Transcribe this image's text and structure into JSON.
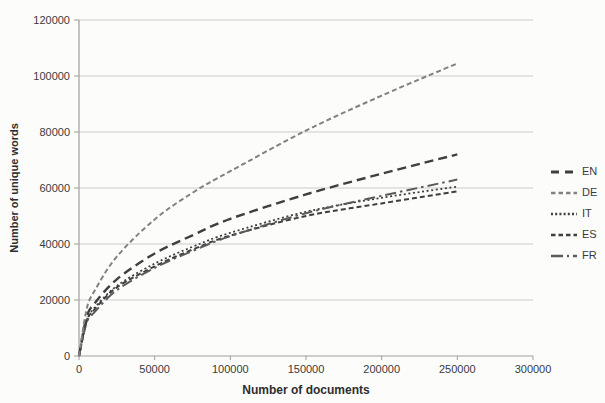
{
  "chart_data": {
    "type": "line",
    "title": "",
    "xlabel": "Number of documents",
    "ylabel": "Number of unique words",
    "xlim": [
      0,
      300000
    ],
    "ylim": [
      0,
      120000
    ],
    "xticks": [
      0,
      50000,
      100000,
      150000,
      200000,
      250000,
      300000
    ],
    "yticks": [
      0,
      20000,
      40000,
      60000,
      80000,
      100000,
      120000
    ],
    "grid": "horizontal",
    "legend_position": "right",
    "x": [
      0,
      5000,
      10000,
      25000,
      50000,
      75000,
      100000,
      150000,
      200000,
      250000
    ],
    "series": [
      {
        "name": "EN",
        "values": [
          0,
          13900,
          18600,
          27400,
          36600,
          43100,
          49000,
          57700,
          65100,
          72000
        ],
        "color": "#3f3f3f",
        "dash": "9 5",
        "width": 2.4,
        "key_dash": "8 6",
        "key_width": 3.2
      },
      {
        "name": "DE",
        "values": [
          0,
          16600,
          23000,
          35500,
          48800,
          58300,
          66000,
          80500,
          93000,
          104500
        ],
        "color": "#818181",
        "dash": "5 3",
        "width": 2.0,
        "key_dash": "4.5 3",
        "key_width": 2.6
      },
      {
        "name": "IT",
        "values": [
          0,
          12600,
          17000,
          25000,
          33000,
          39000,
          44000,
          51500,
          56500,
          60500
        ],
        "color": "#404040",
        "dash": "2 2.6",
        "width": 1.8,
        "key_dash": "2 2.2",
        "key_width": 2.4
      },
      {
        "name": "ES",
        "values": [
          0,
          12300,
          16500,
          24500,
          32000,
          38000,
          43000,
          50000,
          54500,
          58800
        ],
        "color": "#3f3f3f",
        "dash": "5 3",
        "width": 2.0,
        "key_dash": "4.5 3",
        "key_width": 2.6
      },
      {
        "name": "FR",
        "values": [
          0,
          11800,
          15500,
          23500,
          31500,
          37500,
          42800,
          51000,
          57200,
          63000
        ],
        "color": "#5a5a5a",
        "dash": "11 4 2.5 4",
        "width": 2.0,
        "key_dash": "12 4 2 4",
        "key_width": 2.4
      }
    ]
  },
  "style": {
    "background": "#fcfcfb",
    "grid_color": "#cbcbcb",
    "axis_color": "#9e9e9e",
    "text_color": "#3a3a3a"
  }
}
